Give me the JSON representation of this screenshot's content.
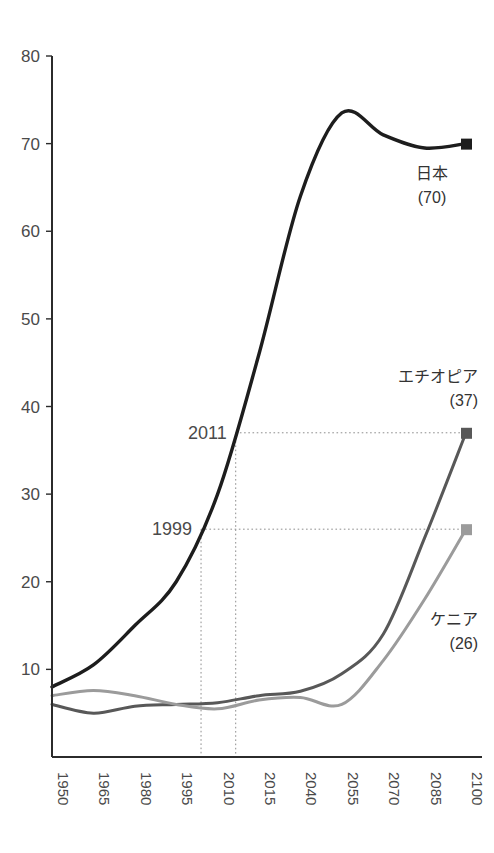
{
  "chart_data": {
    "type": "line",
    "title": "",
    "subtitle": "",
    "xlabel": "",
    "ylabel": "",
    "xlim": [
      1950,
      2100
    ],
    "ylim": [
      0,
      80
    ],
    "grid": false,
    "legend_position": "inline-right-of-series-end",
    "x_tick_labels": [
      "1950",
      "1965",
      "1980",
      "1995",
      "2010",
      "2015",
      "2040",
      "2055",
      "2070",
      "2085",
      "2100"
    ],
    "y_tick_labels": [
      "10",
      "20",
      "30",
      "40",
      "50",
      "60",
      "70",
      "80"
    ],
    "y_ticks": [
      10,
      20,
      30,
      40,
      50,
      60,
      70,
      80
    ],
    "series": [
      {
        "name": "日本",
        "label": "日本",
        "end_value_label": "(70)",
        "end_value": 70,
        "color": "#1d1d1d",
        "x": [
          1950,
          1965,
          1980,
          1995,
          2010,
          2015,
          2040,
          2055,
          2070,
          2085,
          2100
        ],
        "values": [
          8,
          10.5,
          15,
          20,
          30,
          46,
          64,
          73.5,
          71,
          69.5,
          70
        ]
      },
      {
        "name": "エチオピア",
        "label": "エチオピア",
        "end_value_label": "(37)",
        "end_value": 37,
        "color": "#585858",
        "x": [
          1950,
          1965,
          1980,
          1995,
          2010,
          2015,
          2040,
          2055,
          2070,
          2085,
          2100
        ],
        "values": [
          6,
          5,
          5.8,
          6,
          6.2,
          7,
          7.5,
          9.5,
          14,
          25,
          37
        ]
      },
      {
        "name": "ケニア",
        "label": "ケニア",
        "end_value_label": "(26)",
        "end_value": 26,
        "color": "#9b9b9b",
        "x": [
          1950,
          1965,
          1980,
          1995,
          2010,
          2015,
          2040,
          2055,
          2070,
          2085,
          2100
        ],
        "values": [
          7,
          7.6,
          7,
          6,
          5.5,
          6.5,
          6.8,
          6,
          11,
          18,
          26
        ]
      }
    ],
    "annotations": [
      {
        "label": "2011",
        "y_value": 37,
        "description": "guide line from 2011 on the Japan curve across to the エチオピア end point (37)"
      },
      {
        "label": "1999",
        "y_value": 26,
        "description": "guide line from 1999 on the Japan curve across to the ケニア end point (26)"
      }
    ]
  }
}
